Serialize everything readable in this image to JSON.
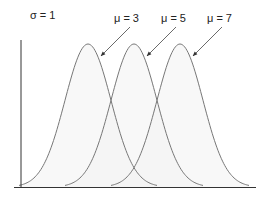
{
  "chart_data": {
    "type": "line",
    "title": "",
    "annotation": "σ = 1",
    "xlabel": "",
    "ylabel": "",
    "grid": false,
    "legend": "none (direct arrow labels)",
    "series": [
      {
        "name": "μ = 3",
        "mean": 3,
        "sd": 1
      },
      {
        "name": "μ = 5",
        "mean": 5,
        "sd": 1
      },
      {
        "name": "μ = 7",
        "mean": 7,
        "sd": 1
      }
    ],
    "xlim": [
      -0.1,
      10.1
    ],
    "ylim": [
      0,
      0.4
    ],
    "fill": "#f3f3f3",
    "stroke": "#777777",
    "axis_color": "#333333"
  },
  "labels": {
    "sigma": "σ = 1",
    "mu3": "μ = 3",
    "mu5": "μ = 5",
    "mu7": "μ = 7"
  }
}
